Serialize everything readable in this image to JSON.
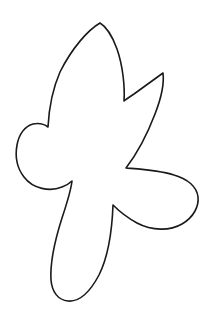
{
  "document": {
    "title": "Leaf Outline Template",
    "kind": "line-art-drawing",
    "subject": "stylized leaf / flower silhouette outline",
    "canvas": {
      "width": 212,
      "height": 319,
      "background_color": "#ffffff"
    }
  },
  "artwork": {
    "name": "leaf-outline",
    "style": "single closed black contour, unfilled interior",
    "stroke_color": "#1a1a1a",
    "fill_color": "#ffffff",
    "stroke_width": 1.6,
    "lobe_count": 5,
    "lobes": [
      "top-pointed-lobe",
      "upper-right-spike",
      "right-rounded-lobe",
      "left-rounded-lobe",
      "bottom-elongated-petal"
    ],
    "key_points": {
      "top_apex": [
        100,
        23
      ],
      "upper_notch_valley": [
        124,
        101
      ],
      "right_spike_tip": [
        163,
        73
      ],
      "right_lobe_notch": [
        126,
        168
      ],
      "right_extreme": [
        198,
        197
      ],
      "lower_right_notch": [
        113,
        205
      ],
      "bottom_tip": [
        70,
        301
      ],
      "left_petal_notch": [
        72,
        181
      ],
      "left_extreme": [
        17,
        157
      ],
      "left_upper_notch": [
        48,
        127
      ]
    },
    "path": "M 100 23 C 88 30, 72 48, 60 72 C 53 88, 49 108, 48 127 C 44 124, 38 123, 33 124 C 25 126, 19 134, 17 145 C 15 156, 17 168, 24 177 C 33 189, 50 192, 62 187 C 67 185, 70 183, 72 181 C 71 190, 67 203, 62 218 C 55 240, 50 264, 51 280 C 52 292, 58 300, 68 301 C 79 302, 90 292, 99 275 C 108 257, 112 232, 113 205 C 118 210, 126 217, 137 223 C 152 231, 170 231, 182 224 C 194 217, 199 206, 198 197 C 197 187, 188 179, 174 175 C 158 170, 138 169, 126 168 C 136 155, 147 135, 155 114 C 162 96, 164 81, 163 73 C 156 78, 145 86, 134 94 C 128 98, 125 100, 124 101 C 125 88, 123 66, 117 49 C 112 35, 105 26, 100 23 Z"
  }
}
